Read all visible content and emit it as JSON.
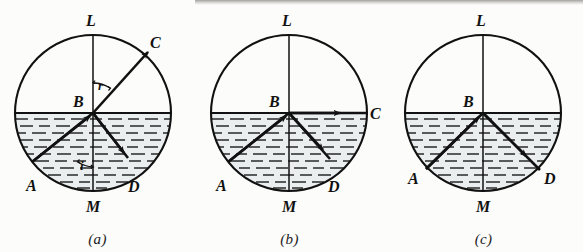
{
  "figure": {
    "background_color": "#fcfcfa",
    "ink_color": "#111111",
    "water_tint": "#e9edee",
    "panel_count": 3
  },
  "panels": [
    {
      "id": "a",
      "caption": "(a)",
      "description": "Ray refracts out of the water; angle of incidence i less than critical angle, refracted ray BC bends away from normal.",
      "labels": {
        "top": "L",
        "center": "B",
        "bottom": "M",
        "left_bottom": "A",
        "right_bottom": "D",
        "exit_point": "C",
        "angle_refraction": "r",
        "angle_incidence": "i"
      },
      "rays": [
        {
          "name": "incident-ray",
          "from": "A",
          "to": "B",
          "arrow": true
        },
        {
          "name": "reflected-ray",
          "from": "B",
          "to": "D",
          "arrow": true
        },
        {
          "name": "refracted-ray",
          "from": "B",
          "to": "C",
          "arrow": true
        }
      ],
      "geometry": {
        "cx": 93,
        "cy": 113,
        "r": 78,
        "water_level_y": 113,
        "A_deg": 219,
        "D_deg": 295,
        "C_deg": 35
      }
    },
    {
      "id": "b",
      "caption": "(b)",
      "description": "Angle of incidence equals the critical angle; refracted ray BC grazes along the water surface at 90 degrees.",
      "labels": {
        "top": "L",
        "center": "B",
        "bottom": "M",
        "left_bottom": "A",
        "right_bottom": "D",
        "exit_point": "C"
      },
      "rays": [
        {
          "name": "incident-ray",
          "from": "A",
          "to": "B",
          "arrow": true
        },
        {
          "name": "reflected-ray",
          "from": "B",
          "to": "D",
          "arrow": true
        },
        {
          "name": "refracted-ray",
          "from": "B",
          "to": "C",
          "arrow": true
        }
      ],
      "geometry": {
        "cx": 97,
        "cy": 113,
        "r": 78,
        "water_level_y": 113,
        "A_deg": 218,
        "D_deg": 302,
        "C_deg": 0
      }
    },
    {
      "id": "c",
      "caption": "(c)",
      "description": "Angle of incidence greater than the critical angle; total internal reflection, no refracted ray emerges.",
      "labels": {
        "top": "L",
        "center": "B",
        "bottom": "M",
        "left_bottom": "A",
        "right_bottom": "D"
      },
      "rays": [
        {
          "name": "incident-ray",
          "from": "A",
          "to": "B",
          "arrow": true
        },
        {
          "name": "reflected-ray",
          "from": "B",
          "to": "D",
          "arrow": true
        }
      ],
      "geometry": {
        "cx": 97,
        "cy": 113,
        "r": 78,
        "water_level_y": 113,
        "A_deg": 223,
        "D_deg": 317
      }
    }
  ]
}
